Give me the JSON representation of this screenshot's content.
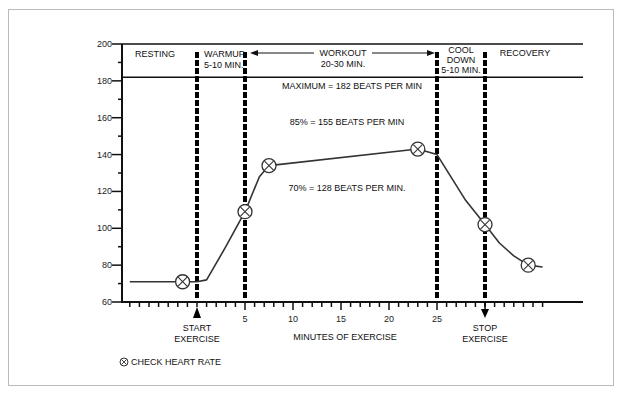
{
  "chart_data": {
    "type": "line",
    "title": "",
    "xlabel": "MINUTES OF EXERCISE",
    "ylabel": "",
    "ylim": [
      60,
      200
    ],
    "xlim": [
      -7,
      35
    ],
    "y_ticks": [
      "200",
      "180",
      "160",
      "140",
      "120",
      "100",
      "80",
      "60"
    ],
    "x_ticks": [
      "5",
      "10",
      "15",
      "20",
      "25"
    ],
    "series": [
      {
        "name": "Heart rate",
        "x": [
          -7,
          -1.5,
          0,
          1,
          5,
          7.5,
          23,
          25,
          28,
          30,
          33,
          36
        ],
        "values": [
          71,
          71,
          71,
          72,
          109,
          134,
          143,
          140,
          115,
          102,
          85,
          79
        ]
      }
    ],
    "check_points": [
      {
        "x": -1.5,
        "y": 71
      },
      {
        "x": 5,
        "y": 109
      },
      {
        "x": 7.5,
        "y": 134
      },
      {
        "x": 23,
        "y": 143
      },
      {
        "x": 30,
        "y": 102
      },
      {
        "x": 34.5,
        "y": 80
      }
    ],
    "reference_lines": [
      {
        "label": "MAXIMUM = 182 BEATS PER MIN",
        "y": 182
      },
      {
        "label": "85% = 155 BEATS PER MIN",
        "y": 155
      },
      {
        "label": "70% = 128 BEATS PER MIN.",
        "y": 128
      }
    ],
    "phases": [
      {
        "label": "RESTING",
        "sub": ""
      },
      {
        "label": "WARMUP",
        "sub": "5-10 MIN."
      },
      {
        "label": "WORKOUT",
        "sub": "20-30 MIN."
      },
      {
        "label": "COOL",
        "sub": "DOWN",
        "sub2": "5-10 MIN."
      },
      {
        "label": "RECOVERY",
        "sub": ""
      }
    ],
    "annotations": {
      "start": [
        "START",
        "EXERCISE"
      ],
      "stop": [
        "STOP",
        "EXERCISE"
      ]
    },
    "legend": "CHECK HEART RATE",
    "grid": false
  }
}
